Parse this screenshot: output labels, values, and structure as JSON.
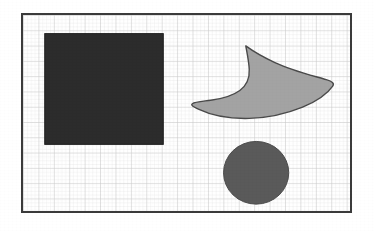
{
  "figure": {
    "title": "Geometric shapes on graph-paper grid",
    "caption": "",
    "background_color": "#ffffff",
    "border_color": "#3b3b3b",
    "border_width_px": 2
  },
  "plate": {
    "x": 21,
    "y": 13,
    "width": 331,
    "height": 200
  },
  "grid": {
    "enabled": true,
    "minor_color": "#e9e9e9",
    "major_color": "#c9c9c9",
    "minor_spacing_px": 3.9,
    "major_spacing_px": 15.6,
    "columns": 21,
    "rows": 13
  },
  "chart_data": {
    "type": "scatter",
    "title": "Geometric shapes on graph-paper grid",
    "xlabel": "",
    "ylabel": "",
    "grid": true,
    "legend_position": "none",
    "xlim": [
      0,
      331
    ],
    "ylim": [
      0,
      200
    ],
    "shapes": [
      {
        "name": "square",
        "label": "dark square",
        "kind": "rectangle",
        "fill": "#2c2c2c",
        "stroke": "#1c1c1c",
        "stroke_width": 1,
        "x": 22,
        "y": 19,
        "width": 120,
        "height": 113,
        "center": [
          82,
          75.5
        ],
        "area_px": 13560
      },
      {
        "name": "crescent",
        "label": "gray boomerang crescent",
        "kind": "path",
        "fill": "#a3a3a3",
        "stroke": "#4a4a4a",
        "stroke_width": 1.4,
        "bbox": [
          171,
          31,
          143,
          68
        ],
        "tips": [
          [
            225,
            31
          ],
          [
            171,
            93
          ],
          [
            314,
            69
          ]
        ],
        "area_px": 5900
      },
      {
        "name": "circle",
        "label": "dark gray circle",
        "kind": "ellipse",
        "fill": "#5a5a5a",
        "stroke": "#4a4a4a",
        "stroke_width": 1,
        "center": [
          236,
          161
        ],
        "radius_x": 33,
        "radius_y": 32,
        "area_px": 3318
      }
    ]
  },
  "shape_labels": {
    "square": "Square",
    "crescent": "Crescent",
    "circle": "Circle"
  }
}
